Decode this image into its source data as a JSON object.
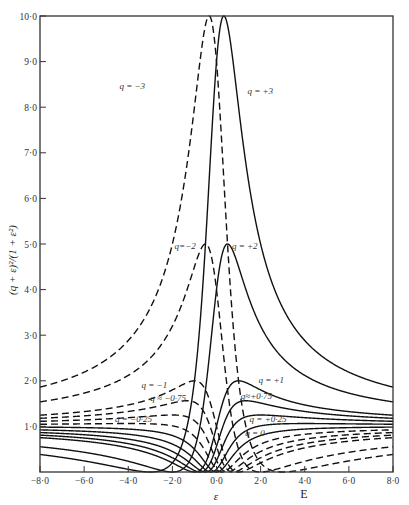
{
  "chart_data": {
    "type": "line",
    "title": "",
    "function": "(q + ε)^2 / (1 + ε^2)",
    "xlabel": "ε",
    "xlabel_secondary": "E",
    "ylabel": "(q + ε)²/(1 + ε²)",
    "xlim": [
      -8.0,
      8.0
    ],
    "ylim": [
      0.0,
      10.0
    ],
    "x_ticks": [
      -8.0,
      -6.0,
      -4.0,
      -2.0,
      0.0,
      2.0,
      4.0,
      6.0,
      8.0
    ],
    "x_tick_labels": [
      "−8·0",
      "−6·0",
      "−4·0",
      "−2·0",
      "0·0",
      "2·0",
      "4·0",
      "6·0",
      "8·0"
    ],
    "y_ticks": [
      1.0,
      2.0,
      3.0,
      4.0,
      5.0,
      6.0,
      7.0,
      8.0,
      9.0,
      10.0
    ],
    "y_tick_labels": [
      "1·0",
      "2·0",
      "3·0",
      "4·0",
      "5·0",
      "6·0",
      "7·0",
      "8·0",
      "9·0",
      "10·0"
    ],
    "grid": false,
    "legend": "inline labels",
    "series": [
      {
        "name": "q = +3",
        "q": 3,
        "style": "solid",
        "label": "q = +3",
        "label_pos": [
          1.4,
          8.3
        ]
      },
      {
        "name": "q = −3",
        "q": -3,
        "style": "dashed",
        "label": "q = −3",
        "label_pos": [
          -4.4,
          8.4
        ]
      },
      {
        "name": "q = +2",
        "q": 2,
        "style": "solid",
        "label": "q = +2",
        "label_pos": [
          0.7,
          4.9
        ]
      },
      {
        "name": "q = −2",
        "q": -2,
        "style": "dashed",
        "label": "q=−2",
        "label_pos": [
          -1.9,
          4.9
        ]
      },
      {
        "name": "q = +1",
        "q": 1,
        "style": "solid",
        "label": "q = +1",
        "label_pos": [
          1.9,
          1.95
        ]
      },
      {
        "name": "q = −1",
        "q": -1,
        "style": "dashed",
        "label": "q = −1",
        "label_pos": [
          -3.4,
          1.85
        ]
      },
      {
        "name": "q = +0·75",
        "q": 0.75,
        "style": "solid",
        "label": "q≈+0·75",
        "label_pos": [
          1.1,
          1.6
        ]
      },
      {
        "name": "q = −0·75",
        "q": -0.75,
        "style": "dashed",
        "label": "q ≈ −0·75",
        "label_pos": [
          -3.0,
          1.55
        ]
      },
      {
        "name": "q = +0·5",
        "q": 0.5,
        "style": "solid",
        "label": "",
        "label_pos": null
      },
      {
        "name": "q = −0·5",
        "q": -0.5,
        "style": "dashed",
        "label": "",
        "label_pos": null
      },
      {
        "name": "q = +0·25",
        "q": 0.25,
        "style": "solid",
        "label": "q = +0·25",
        "label_pos": [
          1.5,
          1.1
        ]
      },
      {
        "name": "q = −0·25",
        "q": -0.25,
        "style": "dashed",
        "label": "q = −0·25",
        "label_pos": [
          -4.6,
          1.1
        ]
      },
      {
        "name": "q = 0",
        "q": 0,
        "style": "solid",
        "label": "q = 0",
        "label_pos": [
          1.3,
          0.78
        ]
      }
    ]
  }
}
